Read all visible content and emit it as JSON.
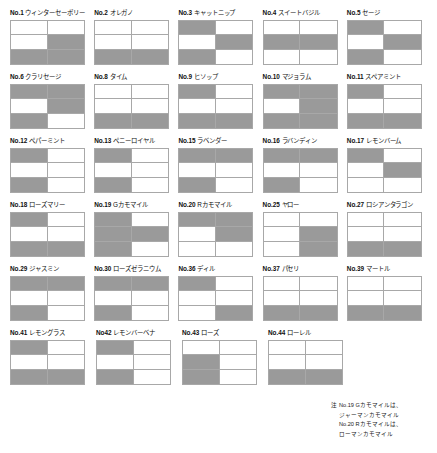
{
  "page": {
    "shade_color": "#9a9a9a",
    "empty_color": "#ffffff",
    "border_color": "#a8a8a8"
  },
  "chart_data": {
    "type": "heatmap",
    "grid": {
      "cols": 2,
      "rows": 3
    },
    "legend": {
      "filled": "該当",
      "empty": "非該当"
    },
    "items": [
      {
        "no": "No.1",
        "name": "ウィンターセーボリー",
        "cells": [
          0,
          0,
          0,
          1,
          1,
          1
        ]
      },
      {
        "no": "No.2",
        "name": "オレガノ",
        "cells": [
          0,
          0,
          0,
          0,
          1,
          1
        ]
      },
      {
        "no": "No.3",
        "name": "キャットニップ",
        "cells": [
          1,
          0,
          0,
          1,
          1,
          0
        ]
      },
      {
        "no": "No.4",
        "name": "スイートバジル",
        "cells": [
          0,
          0,
          1,
          1,
          0,
          0
        ]
      },
      {
        "no": "No.5",
        "name": "セージ",
        "cells": [
          1,
          0,
          0,
          1,
          1,
          0
        ]
      },
      {
        "no": "No.6",
        "name": "クラリセージ",
        "cells": [
          1,
          1,
          0,
          1,
          1,
          0
        ]
      },
      {
        "no": "No.8",
        "name": "タイム",
        "cells": [
          0,
          0,
          0,
          0,
          1,
          1
        ]
      },
      {
        "no": "No.9",
        "name": "ヒソップ",
        "cells": [
          1,
          0,
          0,
          0,
          1,
          1
        ]
      },
      {
        "no": "No.10",
        "name": "マジョラム",
        "cells": [
          1,
          1,
          0,
          1,
          1,
          1
        ]
      },
      {
        "no": "No.11",
        "name": "スペアミント",
        "cells": [
          1,
          0,
          0,
          0,
          1,
          1
        ]
      },
      {
        "no": "No.12",
        "name": "ペパーミント",
        "cells": [
          1,
          0,
          0,
          0,
          1,
          0
        ]
      },
      {
        "no": "No.13",
        "name": "ペニーロイヤル",
        "cells": [
          1,
          0,
          0,
          0,
          1,
          0
        ]
      },
      {
        "no": "No.15",
        "name": "ラベンダー",
        "cells": [
          1,
          1,
          0,
          0,
          1,
          0
        ]
      },
      {
        "no": "No.16",
        "name": "ラバンディン",
        "cells": [
          1,
          1,
          0,
          0,
          1,
          0
        ]
      },
      {
        "no": "No.17",
        "name": "レモンバーム",
        "cells": [
          1,
          0,
          0,
          1,
          0,
          0
        ]
      },
      {
        "no": "No.18",
        "name": "ローズマリー",
        "cells": [
          1,
          0,
          0,
          0,
          1,
          1
        ]
      },
      {
        "no": "No.19",
        "name": "Gカモマイル",
        "cells": [
          1,
          0,
          1,
          1,
          1,
          0
        ]
      },
      {
        "no": "No.20",
        "name": "Rカモマイル",
        "cells": [
          1,
          1,
          0,
          1,
          0,
          0
        ]
      },
      {
        "no": "No.25",
        "name": "ヤロー",
        "cells": [
          0,
          0,
          0,
          1,
          0,
          1
        ]
      },
      {
        "no": "No.27",
        "name": "ロシアンタラゴン",
        "cells": [
          0,
          0,
          0,
          0,
          1,
          1
        ]
      },
      {
        "no": "No.29",
        "name": "ジャスミン",
        "cells": [
          1,
          1,
          0,
          0,
          1,
          0
        ]
      },
      {
        "no": "No.30",
        "name": "ローズゼラニウム",
        "cells": [
          1,
          1,
          0,
          0,
          1,
          0
        ]
      },
      {
        "no": "No.36",
        "name": "ディル",
        "cells": [
          1,
          0,
          0,
          0,
          0,
          1
        ]
      },
      {
        "no": "No.37",
        "name": "パセリ",
        "cells": [
          0,
          0,
          0,
          0,
          1,
          1
        ]
      },
      {
        "no": "No.39",
        "name": "マートル",
        "cells": [
          0,
          0,
          0,
          0,
          1,
          1
        ]
      },
      {
        "no": "No.41",
        "name": "レモングラス",
        "cells": [
          1,
          0,
          0,
          0,
          1,
          1
        ]
      },
      {
        "no": "No42",
        "name": "レモンバーベナ",
        "cells": [
          1,
          0,
          0,
          0,
          1,
          0
        ]
      },
      {
        "no": "No.43",
        "name": "ローズ",
        "cells": [
          0,
          0,
          1,
          0,
          1,
          0
        ]
      },
      {
        "no": "No.44",
        "name": "ローレル",
        "cells": [
          0,
          0,
          0,
          0,
          1,
          1
        ]
      }
    ]
  },
  "footnote": {
    "mark": "注",
    "line1": "No.19 Gカモマイルは、",
    "line2": "ジャーマンカモマイル",
    "line3": "No.20 Rカモマイルは、",
    "line4": "ローマンカモマイル"
  }
}
